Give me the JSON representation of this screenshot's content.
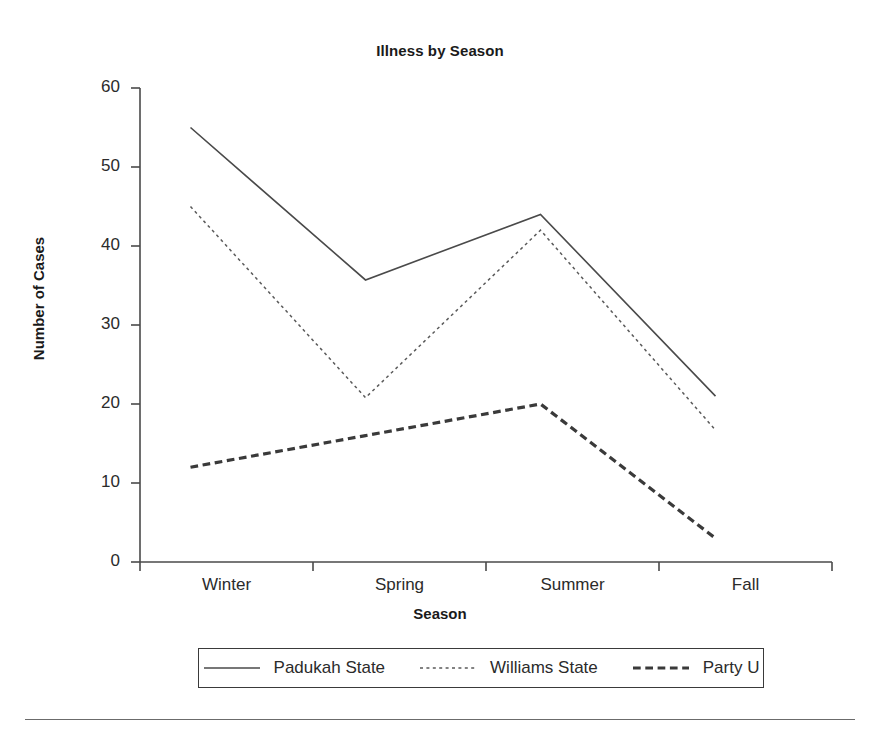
{
  "chart_data": {
    "type": "line",
    "title": "Illness by Season",
    "xlabel": "Season",
    "ylabel": "Number of Cases",
    "categories": [
      "Winter",
      "Spring",
      "Summer",
      "Fall"
    ],
    "ylim": [
      0,
      60
    ],
    "yticks": [
      "0",
      "10",
      "20",
      "30",
      "40",
      "50",
      "60"
    ],
    "grid": false,
    "legend_position": "bottom",
    "series": [
      {
        "name": "Padukah State",
        "style": "solid",
        "color": "#4a4a4a",
        "width": 1.6,
        "values": [
          55,
          35.7,
          44,
          21
        ]
      },
      {
        "name": "Williams State",
        "style": "dotted",
        "color": "#5a5a5a",
        "width": 1.5,
        "values": [
          45,
          20.8,
          42,
          16.7
        ]
      },
      {
        "name": "Party U",
        "style": "dashed",
        "color": "#3a3a3a",
        "width": 3.2,
        "values": [
          12,
          16,
          20,
          3
        ]
      }
    ]
  }
}
